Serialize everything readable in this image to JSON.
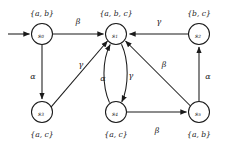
{
  "diagram": {
    "type": "finite-state-automaton",
    "title": "",
    "stroke_color": "#1a1a1a",
    "background_color": "#ffffff",
    "start_marker": "initial-arrow",
    "nodes": [
      {
        "id": "s0",
        "label": "s",
        "subscript": "0",
        "set_label": "{a, b}",
        "set_position": "above",
        "cx": 42,
        "cy": 34,
        "r": 10.5
      },
      {
        "id": "s1",
        "label": "s",
        "subscript": "1",
        "set_label": "{a, b, c}",
        "set_position": "above",
        "cx": 116,
        "cy": 34,
        "r": 10.5
      },
      {
        "id": "s2",
        "label": "s",
        "subscript": "2",
        "set_label": "{b, c}",
        "set_position": "above",
        "cx": 199,
        "cy": 34,
        "r": 10.5
      },
      {
        "id": "s3",
        "label": "s",
        "subscript": "3",
        "set_label": "{a, c}",
        "set_position": "below",
        "cx": 42,
        "cy": 112,
        "r": 10.5
      },
      {
        "id": "s4",
        "label": "s",
        "subscript": "4",
        "set_label": "{a, c}",
        "set_position": "below",
        "cx": 116,
        "cy": 112,
        "r": 10.5
      },
      {
        "id": "s5",
        "label": "s",
        "subscript": "5",
        "set_label": "{a, b}",
        "set_position": "below",
        "cx": 199,
        "cy": 112,
        "r": 10.5
      }
    ],
    "edges": [
      {
        "id": "start-s0",
        "from": "start",
        "to": "s0",
        "label": "",
        "shape": "straight"
      },
      {
        "id": "s0-s1",
        "from": "s0",
        "to": "s1",
        "label": "β",
        "shape": "straight",
        "label_x": 78,
        "label_y": 24
      },
      {
        "id": "s0-s3",
        "from": "s0",
        "to": "s3",
        "label": "α",
        "shape": "straight",
        "label_x": 34,
        "label_y": 76
      },
      {
        "id": "s2-s1",
        "from": "s2",
        "to": "s1",
        "label": "γ",
        "shape": "straight",
        "label_x": 159,
        "label_y": 24
      },
      {
        "id": "s3-s1",
        "from": "s3",
        "to": "s1",
        "label": "γ",
        "shape": "straight",
        "label_x": 81,
        "label_y": 67
      },
      {
        "id": "s4-s1",
        "from": "s4",
        "to": "s1",
        "label": "α",
        "shape": "curve-left",
        "label_x": 104,
        "label_y": 78
      },
      {
        "id": "s1-s4",
        "from": "s1",
        "to": "s4",
        "label": "γ",
        "shape": "curve-right",
        "label_x": 130,
        "label_y": 75
      },
      {
        "id": "s5-s1",
        "from": "s5",
        "to": "s1",
        "label": "β",
        "shape": "straight",
        "label_x": 163,
        "label_y": 67
      },
      {
        "id": "s4-s5",
        "from": "s4",
        "to": "s5",
        "label": "β",
        "shape": "straight",
        "label_x": 157,
        "label_y": 131
      },
      {
        "id": "s5-s2",
        "from": "s5",
        "to": "s2",
        "label": "α",
        "shape": "straight",
        "label_x": 208,
        "label_y": 76
      }
    ]
  }
}
